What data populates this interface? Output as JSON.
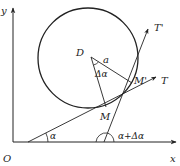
{
  "diagram": {
    "type": "geometry",
    "axes": {
      "x_label": "x",
      "y_label": "y",
      "origin_label": "O"
    },
    "points": {
      "center": "D",
      "point_m": "M",
      "point_m_prime": "M'"
    },
    "tangents": {
      "t": "T",
      "t_prime": "T'"
    },
    "annotations": {
      "radius": "a",
      "angle_delta": "Δα",
      "angle_alpha": "α",
      "angle_alpha_plus_delta": "α+Δα"
    },
    "colors": {
      "stroke": "#222222",
      "background": "#ffffff"
    }
  }
}
